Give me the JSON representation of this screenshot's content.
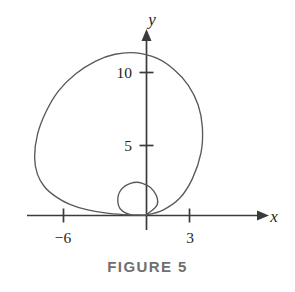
{
  "figure": {
    "caption": "FIGURE 5",
    "caption_color": "#6f6f6f",
    "background_color": "#ffffff",
    "axis_color": "#3b3b3b",
    "curve_color": "#595959"
  },
  "axes": {
    "x_label": "x",
    "y_label": "y",
    "x_ticks": [
      {
        "value": -6,
        "label": "−6"
      },
      {
        "value": 3,
        "label": "3"
      }
    ],
    "y_ticks": [
      {
        "value": 5,
        "label": "5"
      },
      {
        "value": 10,
        "label": "10"
      }
    ],
    "origin_px": {
      "x": 146,
      "y": 215
    },
    "scale_px_per_unit": 14.1
  },
  "chart_data": {
    "type": "line",
    "title": "FIGURE 5",
    "xlabel": "x",
    "ylabel": "y",
    "grid": false,
    "legend": "none",
    "xlim": [
      -9.5,
      10.5
    ],
    "ylim": [
      -1.5,
      15.3
    ],
    "xticks": [
      -6,
      3
    ],
    "xticklabels": [
      "−6",
      "3"
    ],
    "yticks": [
      5,
      10
    ],
    "yticklabels": [
      "5",
      "10"
    ],
    "annotations": [
      "FIGURE 5"
    ],
    "series": [
      {
        "name": "limacon-outer-and-inner-loop",
        "curve_kind": "limacon",
        "description": "Polar limacon r = a + b*sin(theta) with inner loop; outer loop peaks near (-1, 11.5), crosses x-axis near x = -7.9 on the left and x = 4.0 on the right, small inner loop sits just above the origin spanning about x in [-2, 0.8] and y in [0, 2.3].",
        "closed": true,
        "x": [
          0.0,
          0.8,
          0.55,
          -0.25,
          -1.1,
          -1.8,
          -2.0,
          -1.75,
          -1.1,
          -0.4,
          0.0,
          1.2,
          2.4,
          3.3,
          3.9,
          4.0,
          3.7,
          3.0,
          2.0,
          0.8,
          -0.7,
          -2.2,
          -3.6,
          -5.0,
          -6.2,
          -7.1,
          -7.7,
          -7.9,
          -7.7,
          -7.2,
          -6.4,
          -5.4,
          -4.2,
          -2.9,
          -1.6,
          -0.6,
          0.0
        ],
        "y": [
          0.0,
          0.75,
          1.7,
          2.25,
          2.25,
          1.75,
          1.0,
          0.35,
          0.02,
          0.0,
          0.0,
          0.35,
          1.2,
          2.6,
          4.4,
          6.2,
          7.8,
          9.2,
          10.3,
          11.1,
          11.5,
          11.4,
          10.9,
          10.0,
          8.8,
          7.3,
          5.7,
          4.1,
          2.9,
          2.0,
          1.3,
          0.75,
          0.38,
          0.15,
          0.03,
          0.0,
          0.0
        ]
      }
    ]
  }
}
